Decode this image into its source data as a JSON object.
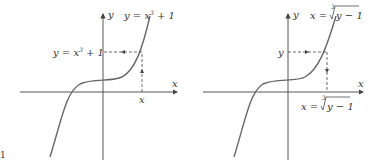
{
  "figure_marker": "1",
  "panels": [
    {
      "name": "left",
      "axis_x_label": "x",
      "axis_y_label": "y",
      "curve_label_main": "y = x",
      "curve_label_exp": "3",
      "curve_label_tail": " + 1",
      "y_marker_main": "y = x",
      "y_marker_exp": "3",
      "y_marker_tail": " + 1",
      "x_marker": "x"
    },
    {
      "name": "right",
      "axis_x_label": "x",
      "axis_y_label": "y",
      "curve_label_main": "x = ",
      "curve_label_index": "3",
      "curve_label_radicand": "y − 1",
      "y_marker": "y",
      "x_marker_main": "x = ",
      "x_marker_index": "3",
      "x_marker_radicand": "y − 1"
    }
  ]
}
